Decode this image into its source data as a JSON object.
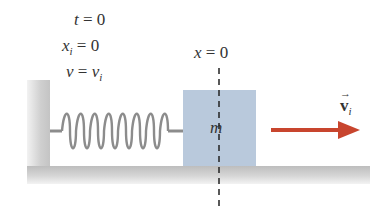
{
  "conditions": {
    "time": {
      "var": "t",
      "eq": " = ",
      "value": "0"
    },
    "position": {
      "var": "x",
      "sub": "i",
      "eq": " = ",
      "value": "0"
    },
    "velocity": {
      "var": "v",
      "eq": " = ",
      "value": "v",
      "value_sub": "i"
    }
  },
  "origin_label": {
    "var": "x",
    "eq": " = ",
    "value": "0"
  },
  "mass_label": "m",
  "velocity_vector": {
    "symbol": "v",
    "sub": "i",
    "arrow": "→"
  },
  "colors": {
    "block": "#b9c9dc",
    "arrow": "#c8452e",
    "spring": "#8c8c8c",
    "wall_floor": "#c8c8c8"
  }
}
